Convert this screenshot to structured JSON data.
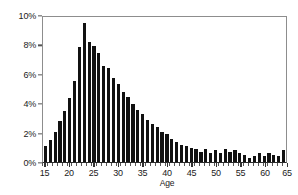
{
  "chart_data": {
    "type": "bar",
    "title": "",
    "subtitle": "",
    "xlabel": "Age",
    "ylabel": "",
    "xlim": [
      14.5,
      65
    ],
    "ylim": [
      0,
      10
    ],
    "grid": false,
    "legend": null,
    "bar_color": "#111111",
    "frame_color": "#8d8d8d",
    "axis_color": "#2b2b2b",
    "y_tick_labels": [
      "0%",
      "2%",
      "4%",
      "6%",
      "8%",
      "10%"
    ],
    "y_tick_values": [
      0,
      2,
      4,
      6,
      8,
      10
    ],
    "x_tick_labels": [
      "15",
      "20",
      "25",
      "30",
      "35",
      "40",
      "45",
      "50",
      "55",
      "60",
      "65"
    ],
    "x_tick_values": [
      15,
      20,
      25,
      30,
      35,
      40,
      45,
      50,
      55,
      60,
      65
    ],
    "categories": [
      15,
      16,
      17,
      18,
      19,
      20,
      21,
      22,
      23,
      24,
      25,
      26,
      27,
      28,
      29,
      30,
      31,
      32,
      33,
      34,
      35,
      36,
      37,
      38,
      39,
      40,
      41,
      42,
      43,
      44,
      45,
      46,
      47,
      48,
      49,
      50,
      51,
      52,
      53,
      54,
      55,
      56,
      57,
      58,
      59,
      60,
      61,
      62,
      63,
      64
    ],
    "values": [
      1.1,
      1.5,
      2.1,
      2.8,
      3.5,
      4.4,
      5.6,
      7.9,
      9.6,
      8.3,
      8.0,
      7.5,
      6.6,
      6.5,
      5.8,
      5.4,
      4.8,
      4.5,
      4.0,
      3.6,
      3.3,
      2.9,
      2.6,
      2.4,
      2.1,
      1.9,
      1.6,
      1.4,
      1.2,
      1.1,
      1.0,
      0.9,
      0.7,
      0.9,
      0.6,
      0.8,
      0.6,
      0.9,
      0.7,
      0.8,
      0.6,
      0.5,
      0.3,
      0.4,
      0.6,
      0.4,
      0.6,
      0.5,
      0.4,
      0.8
    ],
    "units": "percent"
  }
}
